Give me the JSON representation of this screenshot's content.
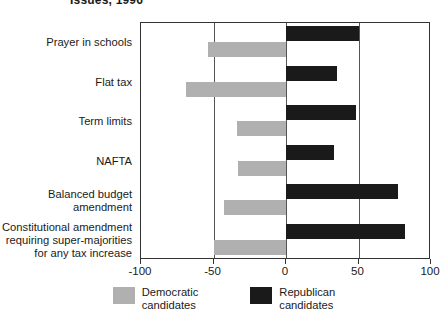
{
  "chart_data": {
    "type": "bar",
    "orientation": "horizontal",
    "title": "Issues, 1996",
    "xlabel": "",
    "ylabel": "",
    "xlim": [
      -100,
      100
    ],
    "xticks": [
      -100,
      -50,
      0,
      50,
      100
    ],
    "xtick_labels": [
      "-100",
      "-50",
      "0",
      "50",
      "100"
    ],
    "grid": true,
    "gridlines": [
      -50,
      0,
      50
    ],
    "legend_position": "bottom",
    "categories": [
      "Prayer in schools",
      "Flat tax",
      "Term limits",
      "NAFTA",
      "Balanced budget amendment",
      "Constitutional amendment requiring super-majorities for any tax increase"
    ],
    "category_lines": [
      [
        "Prayer in schools"
      ],
      [
        "Flat tax"
      ],
      [
        "Term limits"
      ],
      [
        "NAFTA"
      ],
      [
        "Balanced budget",
        "amendment"
      ],
      [
        "Constitutional amendment",
        "requiring super-majorities",
        "for any tax increase"
      ]
    ],
    "series": [
      {
        "name": "Republican candidates",
        "color": "#1a1a1a",
        "values": [
          50,
          35,
          48,
          33,
          77,
          82
        ]
      },
      {
        "name": "Democratic candidates",
        "color": "#b0b0b0",
        "values": [
          -54,
          -69,
          -34,
          -33,
          -43,
          -50
        ]
      }
    ]
  },
  "legend": {
    "items": [
      {
        "label_line1": "Democratic",
        "label_line2": "candidates",
        "swatch": "dem"
      },
      {
        "label_line1": "Republican",
        "label_line2": "candidates",
        "swatch": "rep"
      }
    ]
  }
}
